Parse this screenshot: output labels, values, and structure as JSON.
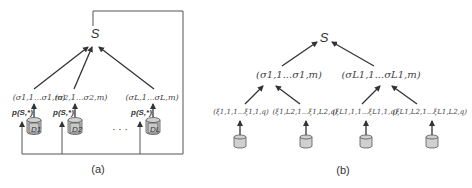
{
  "panel_a": {
    "root_label": "S",
    "sigma_labels": [
      "(σ1,1...σ1,m)",
      "(σ2,1...σ2,m)",
      "(σL,1...σL,m)"
    ],
    "prob_labels": [
      "p(S,*)",
      "p(S,*)",
      "p(S,*)"
    ],
    "datasets": [
      "D1",
      "D2",
      "DL"
    ],
    "ellipsis": "· · ·",
    "caption": "(a)"
  },
  "panel_b": {
    "root_label": "S",
    "sigma_labels": [
      "(σ1,1...σ1,m)",
      "(σL1,1...σL1,m)"
    ],
    "xi_labels": [
      "(ξ1,1,1...ξ1,1,q)",
      "(ξ1,L2,1...ξ1,L2,q)",
      "(ξL1,1,1...ξL1,1,q)",
      "(ξL1,L2,1...ξL1,L2,q)"
    ],
    "ellipsis": "...",
    "caption": "(b)"
  }
}
